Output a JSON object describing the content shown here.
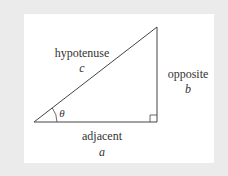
{
  "diagram": {
    "colors": {
      "background": "#ebebeb",
      "panel": "#ffffff",
      "stroke": "#444444",
      "text": "#333333"
    },
    "vertices": {
      "angle_vertex": [
        34,
        122
      ],
      "top_vertex": [
        157,
        27
      ],
      "right_angle_vertex": [
        157,
        122
      ]
    },
    "sides": {
      "hypotenuse": {
        "label": "hypotenuse",
        "variable": "c"
      },
      "opposite": {
        "label": "opposite",
        "variable": "b"
      },
      "adjacent": {
        "label": "adjacent",
        "variable": "a"
      }
    },
    "angle": {
      "symbol": "θ"
    },
    "right_angle_marker": true
  }
}
